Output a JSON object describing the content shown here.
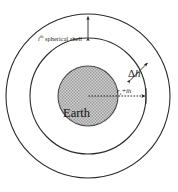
{
  "figure": {
    "canvas": {
      "width": 178,
      "height": 192,
      "background": "#ffffff"
    },
    "center": {
      "x": 88,
      "y": 96
    },
    "stroke_color": "#2b2b2b",
    "earth_fill_color": "#b8b8b8",
    "circles": [
      {
        "name": "outer-shell-boundary",
        "radius": 82
      },
      {
        "name": "inner-shell-boundary",
        "radius": 58
      },
      {
        "name": "earth-surface",
        "radius": 30
      }
    ],
    "labels": {
      "shell": {
        "index": "i",
        "ordinal_suffix": "th",
        "text": " spherical shell",
        "full": "i th spherical shell"
      },
      "delta_h": {
        "symbol": "Δ",
        "variable": "h",
        "full": "Δh"
      },
      "radius": {
        "base": "r",
        "base_subscript": "e",
        "operator": "+",
        "increment": "ih",
        "full": "r e + ih"
      },
      "earth": "Earth"
    },
    "annotations": {
      "shell_thickness_arrow": "double-headed vertical arrow spanning the outer shell",
      "delta_h_arrow": "double-headed radial arrow across the outer shell thickness",
      "radius_arrow": "dashed arrow from centre to the inner shell boundary"
    }
  }
}
